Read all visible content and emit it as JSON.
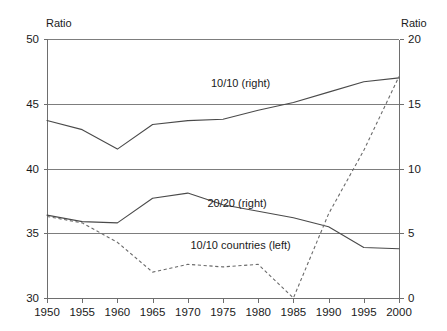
{
  "chart_data": {
    "type": "line",
    "title": "",
    "xlabel": "",
    "ylabel": "Ratio",
    "y2label": "Ratio",
    "x": [
      1950,
      1955,
      1960,
      1965,
      1970,
      1975,
      1980,
      1985,
      1990,
      1995,
      2000
    ],
    "xlim": [
      1950,
      2000
    ],
    "ylim": [
      30,
      50
    ],
    "y2lim": [
      0,
      20
    ],
    "yticks": [
      30,
      35,
      40,
      45,
      50
    ],
    "y2ticks": [
      0,
      5,
      10,
      15,
      20
    ],
    "xticks": [
      1950,
      1955,
      1960,
      1965,
      1970,
      1975,
      1980,
      1985,
      1990,
      1995,
      2000
    ],
    "grid": "horizontal",
    "legend": "inline-annotations",
    "series": [
      {
        "name": "10/10 (right)",
        "axis": "right",
        "style": "solid",
        "label_x": 1977.5,
        "label_y_left": 46.6,
        "values_left": [
          43.7,
          43.0,
          41.5,
          43.4,
          43.7,
          43.8,
          44.5,
          45.1,
          45.9,
          46.7,
          47.0
        ],
        "values_right": [
          13.7,
          13.0,
          11.5,
          13.4,
          13.7,
          13.8,
          14.5,
          15.1,
          15.9,
          16.7,
          17.0
        ]
      },
      {
        "name": "20/20 (right)",
        "axis": "right",
        "style": "solid",
        "label_x": 1977.0,
        "label_y_left": 37.3,
        "values_left": [
          36.4,
          35.9,
          35.8,
          37.7,
          38.1,
          37.2,
          36.7,
          36.2,
          35.5,
          33.9,
          33.8
        ],
        "values_right": [
          6.4,
          5.9,
          5.8,
          7.7,
          8.1,
          7.2,
          6.7,
          6.2,
          5.5,
          3.9,
          3.8
        ]
      },
      {
        "name": "10/10 countries (left)",
        "axis": "left",
        "style": "dashed",
        "label_x": 1977.5,
        "label_y_left": 34.1,
        "values_left": [
          36.3,
          35.8,
          34.3,
          32.0,
          32.6,
          32.4,
          32.6,
          30.0,
          36.5,
          41.4,
          47.1
        ]
      }
    ]
  },
  "axes": {
    "left_title": "Ratio",
    "right_title": "Ratio",
    "left_tick_labels": [
      "50",
      "45",
      "40",
      "35",
      "30"
    ],
    "right_tick_labels": [
      "20",
      "15",
      "10",
      "5",
      "0"
    ],
    "x_tick_labels": [
      "1950",
      "1955",
      "1960",
      "1965",
      "1970",
      "1975",
      "1980",
      "1985",
      "1990",
      "1995",
      "2000"
    ]
  },
  "annotations": {
    "series_1_label": "10/10 (right)",
    "series_2_label": "20/20 (right)",
    "series_3_label": "10/10 countries (left)"
  },
  "colors": {
    "background": "#ffffff",
    "text": "#1a1a1a",
    "gridline": "#7d7d7d",
    "axis": "#6e6e6e",
    "solid_series": "#4a4a4a",
    "dashed_series": "#6a6a6a"
  }
}
